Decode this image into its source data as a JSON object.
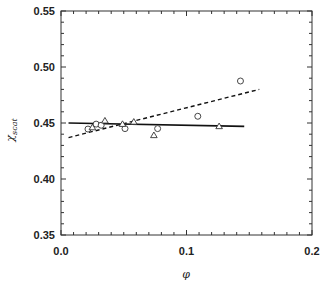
{
  "chart_data": {
    "type": "scatter",
    "title": "",
    "xlabel": "φ",
    "ylabel": "χscat",
    "ylabel_main": "χ",
    "ylabel_sub": "scat",
    "xlim": [
      0.0,
      0.2
    ],
    "ylim": [
      0.35,
      0.55
    ],
    "x_ticks": [
      0.0,
      0.1,
      0.2
    ],
    "x_tick_labels": [
      "0.0",
      "0.1",
      "0.2"
    ],
    "y_ticks": [
      0.35,
      0.4,
      0.45,
      0.5,
      0.55
    ],
    "y_tick_labels": [
      "0.35",
      "0.40",
      "0.45",
      "0.50",
      "0.55"
    ],
    "grid": false,
    "legend": null,
    "series": [
      {
        "name": "circles",
        "marker": "circle",
        "filled": false,
        "points": [
          [
            0.0215,
            0.4446
          ],
          [
            0.028,
            0.449
          ],
          [
            0.032,
            0.448
          ],
          [
            0.051,
            0.445
          ],
          [
            0.077,
            0.445
          ],
          [
            0.109,
            0.456
          ],
          [
            0.143,
            0.4875
          ]
        ]
      },
      {
        "name": "triangles",
        "marker": "triangle",
        "filled": false,
        "points": [
          [
            0.025,
            0.446
          ],
          [
            0.035,
            0.452
          ],
          [
            0.049,
            0.449
          ],
          [
            0.058,
            0.451
          ],
          [
            0.074,
            0.439
          ],
          [
            0.126,
            0.447
          ]
        ]
      },
      {
        "name": "solid fit",
        "type": "line",
        "style": "solid",
        "points": [
          [
            0.006,
            0.45
          ],
          [
            0.146,
            0.447
          ]
        ]
      },
      {
        "name": "dashed fit",
        "type": "line",
        "style": "dashed",
        "points": [
          [
            0.006,
            0.437
          ],
          [
            0.158,
            0.48
          ]
        ]
      }
    ]
  }
}
